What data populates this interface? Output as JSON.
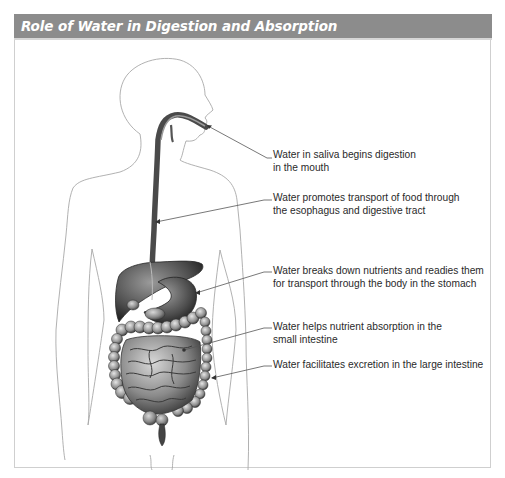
{
  "header": {
    "title": "Role of Water in Digestion and Absorption",
    "background_color": "#8c8c8c",
    "text_color": "#ffffff"
  },
  "illustration": {
    "subject": "Human body outline (side profile head, frontal torso) showing digestive tract",
    "organs": [
      "mouth",
      "esophagus",
      "liver",
      "stomach",
      "small intestine",
      "large intestine"
    ]
  },
  "labels": [
    {
      "id": "mouth",
      "lines": [
        "Water in saliva begins digestion",
        "in the mouth"
      ]
    },
    {
      "id": "esophagus",
      "lines": [
        "Water promotes transport of food through",
        "the esophagus and digestive tract"
      ]
    },
    {
      "id": "stomach",
      "lines": [
        "Water breaks down nutrients and readies them",
        "for transport through the body in the stomach"
      ]
    },
    {
      "id": "small-intestine",
      "lines": [
        "Water helps nutrient absorption in the",
        "small intestine"
      ]
    },
    {
      "id": "large-intestine",
      "lines": [
        "Water facilitates excretion in the large intestine"
      ]
    }
  ]
}
